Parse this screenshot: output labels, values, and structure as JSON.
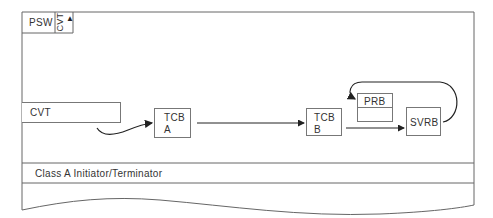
{
  "header": {
    "psw_label": "PSW",
    "cvt_vertical_label": "CVT"
  },
  "blocks": {
    "cvt": "CVT",
    "tcb_a_line1": "TCB",
    "tcb_a_line2": "A",
    "tcb_b_line1": "TCB",
    "tcb_b_line2": "B",
    "prb": "PRB",
    "svrb": "SVRB"
  },
  "sections": {
    "class_a": "Class A Initiator/Terminator"
  },
  "colors": {
    "line": "#555555",
    "box_border": "#777777",
    "text": "#333333"
  }
}
